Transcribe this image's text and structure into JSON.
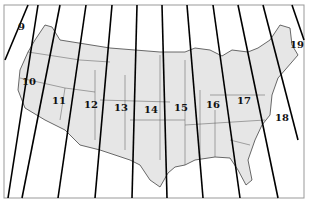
{
  "map": {
    "subject": "UTM zones of the contiguous United States",
    "land_color": "#e6e6e6",
    "line_color": "#111111",
    "zones": [
      {
        "label": "9",
        "x": 18,
        "y": 30
      },
      {
        "label": "10",
        "x": 22,
        "y": 85
      },
      {
        "label": "11",
        "x": 52,
        "y": 104
      },
      {
        "label": "12",
        "x": 84,
        "y": 108
      },
      {
        "label": "13",
        "x": 114,
        "y": 111
      },
      {
        "label": "14",
        "x": 144,
        "y": 113
      },
      {
        "label": "15",
        "x": 174,
        "y": 111
      },
      {
        "label": "16",
        "x": 206,
        "y": 108
      },
      {
        "label": "17",
        "x": 237,
        "y": 104
      },
      {
        "label": "18",
        "x": 275,
        "y": 121
      },
      {
        "label": "19",
        "x": 290,
        "y": 48
      }
    ]
  }
}
